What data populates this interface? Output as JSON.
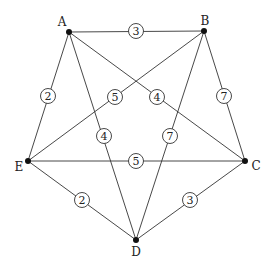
{
  "graph": {
    "nodes": [
      {
        "id": "A",
        "label": "A",
        "x": 69,
        "y": 32,
        "lx": 62,
        "ly": 22
      },
      {
        "id": "B",
        "label": "B",
        "x": 204,
        "y": 31,
        "lx": 205,
        "ly": 21
      },
      {
        "id": "C",
        "label": "C",
        "x": 245,
        "y": 161,
        "lx": 256,
        "ly": 166
      },
      {
        "id": "D",
        "label": "D",
        "x": 136,
        "y": 240,
        "lx": 136,
        "ly": 252
      },
      {
        "id": "E",
        "label": "E",
        "x": 28,
        "y": 161,
        "lx": 19,
        "ly": 167
      }
    ],
    "edges": [
      {
        "from": "A",
        "to": "B",
        "weight": "3",
        "wx": 136,
        "wy": 31
      },
      {
        "from": "A",
        "to": "E",
        "weight": "2",
        "wx": 48,
        "wy": 96
      },
      {
        "from": "A",
        "to": "C",
        "weight": "4",
        "wx": 157,
        "wy": 97
      },
      {
        "from": "A",
        "to": "D",
        "weight": "4",
        "wx": 104,
        "wy": 136
      },
      {
        "from": "B",
        "to": "E",
        "weight": "5",
        "wx": 115,
        "wy": 97
      },
      {
        "from": "B",
        "to": "C",
        "weight": "7",
        "wx": 224,
        "wy": 96
      },
      {
        "from": "B",
        "to": "D",
        "weight": "7",
        "wx": 170,
        "wy": 136
      },
      {
        "from": "E",
        "to": "C",
        "weight": "5",
        "wx": 136,
        "wy": 161
      },
      {
        "from": "E",
        "to": "D",
        "weight": "2",
        "wx": 82,
        "wy": 200
      },
      {
        "from": "D",
        "to": "C",
        "weight": "3",
        "wx": 190,
        "wy": 200
      }
    ]
  }
}
